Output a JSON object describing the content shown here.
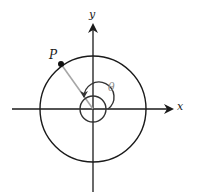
{
  "diagram": {
    "type": "polar-angle-unit-circle",
    "axes": {
      "x_label": "x",
      "y_label": "y"
    },
    "point": {
      "label": "P"
    },
    "angle": {
      "label": "θ"
    },
    "colors": {
      "stroke": "#1a1a1a",
      "radius_line": "#a6a6a6",
      "angle_label": "#8c8c8c",
      "background": "#ffffff"
    }
  }
}
